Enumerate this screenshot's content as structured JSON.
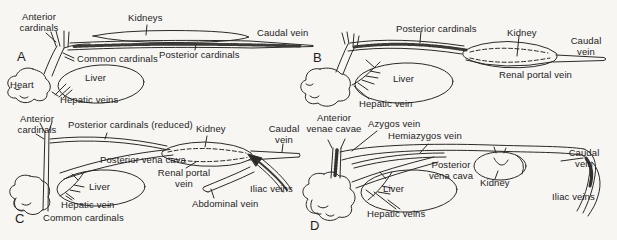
{
  "figure": {
    "background": "#f7f6f3",
    "ink": "#2b2a28"
  },
  "panels": {
    "A": {
      "letter": "A",
      "labels": {
        "anterior_cardinals": "Anterior\ncardinals",
        "kidneys": "Kidneys",
        "caudal_vein": "Caudal vein",
        "common_cardinals": "Common cardinals",
        "posterior_cardinals": "Posterior cardinals",
        "heart": "Heart",
        "liver": "Liver",
        "hepatic_veins": "Hepatic veins"
      }
    },
    "B": {
      "letter": "B",
      "labels": {
        "posterior_cardinals": "Posterior cardinals",
        "kidney": "Kidney",
        "caudal_vein": "Caudal\nvein",
        "liver": "Liver",
        "renal_portal_vein": "Renal portal vein",
        "hepatic_vein": "Hepatic vein"
      }
    },
    "C": {
      "letter": "C",
      "labels": {
        "anterior_cardinals": "Anterior\ncardinals",
        "posterior_cardinals_reduced": "Posterior cardinals (reduced)",
        "kidney": "Kidney",
        "caudal_vein": "Caudal\nvein",
        "posterior_vena_cava": "Posterior vena cava",
        "renal_portal_vein": "Renal portal\nvein",
        "liver": "Liver",
        "iliac_veins": "Iliac veins",
        "hepatic_vein": "Hepatic vein",
        "abdominal_vein": "Abdominal vein",
        "common_cardinals": "Common cardinals"
      }
    },
    "D": {
      "letter": "D",
      "labels": {
        "anterior_venae_cavae": "Anterior\nvenae cavae",
        "azygos_vein": "Azygos vein",
        "hemiazygos_vein": "Hemiazygos vein",
        "posterior_vena_cava": "Posterior\nvena cava",
        "kidney": "Kidney",
        "caudal_vein": "Caudal\nvein",
        "liver": "Liver",
        "iliac_veins": "Iliac veins",
        "hepatic_veins": "Hepatic veins"
      }
    }
  }
}
